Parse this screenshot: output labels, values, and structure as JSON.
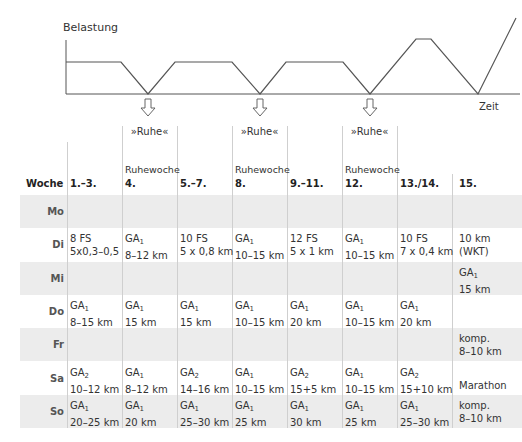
{
  "chart": {
    "ylabel": "Belastung",
    "xlabel": "Zeit",
    "curve_points": [
      [
        66,
        62
      ],
      [
        121,
        62
      ],
      [
        148,
        94
      ],
      [
        175,
        62
      ],
      [
        232,
        62
      ],
      [
        260,
        94
      ],
      [
        286,
        62
      ],
      [
        343,
        62
      ],
      [
        370,
        94
      ],
      [
        416,
        39
      ],
      [
        431,
        39
      ],
      [
        478,
        94
      ],
      [
        516,
        18
      ]
    ],
    "rest_arrows_x": [
      148,
      260,
      370
    ],
    "rest_label": "»Ruhe«"
  },
  "chart_data": {
    "type": "line",
    "title": "",
    "xlabel": "Zeit",
    "ylabel": "Belastung",
    "x": [
      "start",
      "1.-3. end",
      "4. Ruhe",
      "5.-7. start",
      "5.-7. end",
      "8. Ruhe",
      "9.-11. start",
      "9.-11. end",
      "12. Ruhe",
      "13./14. peak start",
      "13./14. peak end",
      "taper low",
      "15. Marathon"
    ],
    "values": [
      0.6,
      0.6,
      0,
      0.6,
      0.6,
      0,
      0.6,
      0.6,
      0,
      1.0,
      1.0,
      0,
      1.4
    ],
    "grid": false
  },
  "table": {
    "corner_label": "Woche",
    "columns": [
      {
        "label": "1.–3.",
        "note": "",
        "ruhe": ""
      },
      {
        "label": "4.",
        "note": "Ruhewoche",
        "ruhe": "»Ruhe«"
      },
      {
        "label": "5.–7.",
        "note": "",
        "ruhe": ""
      },
      {
        "label": "8.",
        "note": "Ruhewoche",
        "ruhe": "»Ruhe«"
      },
      {
        "label": "9.–11.",
        "note": "",
        "ruhe": ""
      },
      {
        "label": "12.",
        "note": "Ruhewoche",
        "ruhe": "»Ruhe«"
      },
      {
        "label": "13./14.",
        "note": "",
        "ruhe": ""
      },
      {
        "label": "15.",
        "note": "",
        "ruhe": ""
      }
    ],
    "rows": [
      {
        "day": "Mo",
        "cells": [
          [
            "",
            ""
          ],
          [
            "",
            ""
          ],
          [
            "",
            ""
          ],
          [
            "",
            ""
          ],
          [
            "",
            ""
          ],
          [
            "",
            ""
          ],
          [
            "",
            ""
          ],
          [
            "",
            ""
          ]
        ]
      },
      {
        "day": "Di",
        "cells": [
          [
            "8 FS",
            "5x0,3–0,5"
          ],
          [
            "GA1",
            "8–12 km"
          ],
          [
            "10 FS",
            "5 x 0,8 km"
          ],
          [
            "GA1",
            "10–15 km"
          ],
          [
            "12 FS",
            "5 x 1 km"
          ],
          [
            "GA1",
            "10–15 km"
          ],
          [
            "10 FS",
            "7 x 0,4 km"
          ],
          [
            "10 km",
            "(WKT)"
          ]
        ]
      },
      {
        "day": "Mi",
        "cells": [
          [
            "",
            ""
          ],
          [
            "",
            ""
          ],
          [
            "",
            ""
          ],
          [
            "",
            ""
          ],
          [
            "",
            ""
          ],
          [
            "",
            ""
          ],
          [
            "",
            ""
          ],
          [
            "GA1",
            "15 km"
          ]
        ]
      },
      {
        "day": "Do",
        "cells": [
          [
            "GA1",
            "8–15 km"
          ],
          [
            "GA1",
            "15 km"
          ],
          [
            "GA1",
            "15 km"
          ],
          [
            "GA1",
            "10–15 km"
          ],
          [
            "GA1",
            "20 km"
          ],
          [
            "GA1",
            "10–15 km"
          ],
          [
            "GA1",
            "20 km"
          ],
          [
            "",
            ""
          ]
        ]
      },
      {
        "day": "Fr",
        "cells": [
          [
            "",
            ""
          ],
          [
            "",
            ""
          ],
          [
            "",
            ""
          ],
          [
            "",
            ""
          ],
          [
            "",
            ""
          ],
          [
            "",
            ""
          ],
          [
            "",
            ""
          ],
          [
            "komp.",
            "8–10 km"
          ]
        ]
      },
      {
        "day": "Sa",
        "cells": [
          [
            "GA2",
            "10–12 km"
          ],
          [
            "GA1",
            "8–12 km"
          ],
          [
            "GA2",
            "14–16 km"
          ],
          [
            "GA1",
            "10–15 km"
          ],
          [
            "GA2",
            "15+5 km"
          ],
          [
            "GA1",
            "10–15 km"
          ],
          [
            "GA2",
            "15+10 km"
          ],
          [
            "",
            "Marathon"
          ]
        ]
      },
      {
        "day": "So",
        "cells": [
          [
            "GA1",
            "20–25 km"
          ],
          [
            "GA1",
            "20 km"
          ],
          [
            "GA1",
            "25–30 km"
          ],
          [
            "GA1",
            "25 km"
          ],
          [
            "GA1",
            "30 km"
          ],
          [
            "GA1",
            "25 km"
          ],
          [
            "GA1",
            "25–30 km"
          ],
          [
            "komp.",
            "8–10 km"
          ]
        ]
      }
    ]
  }
}
